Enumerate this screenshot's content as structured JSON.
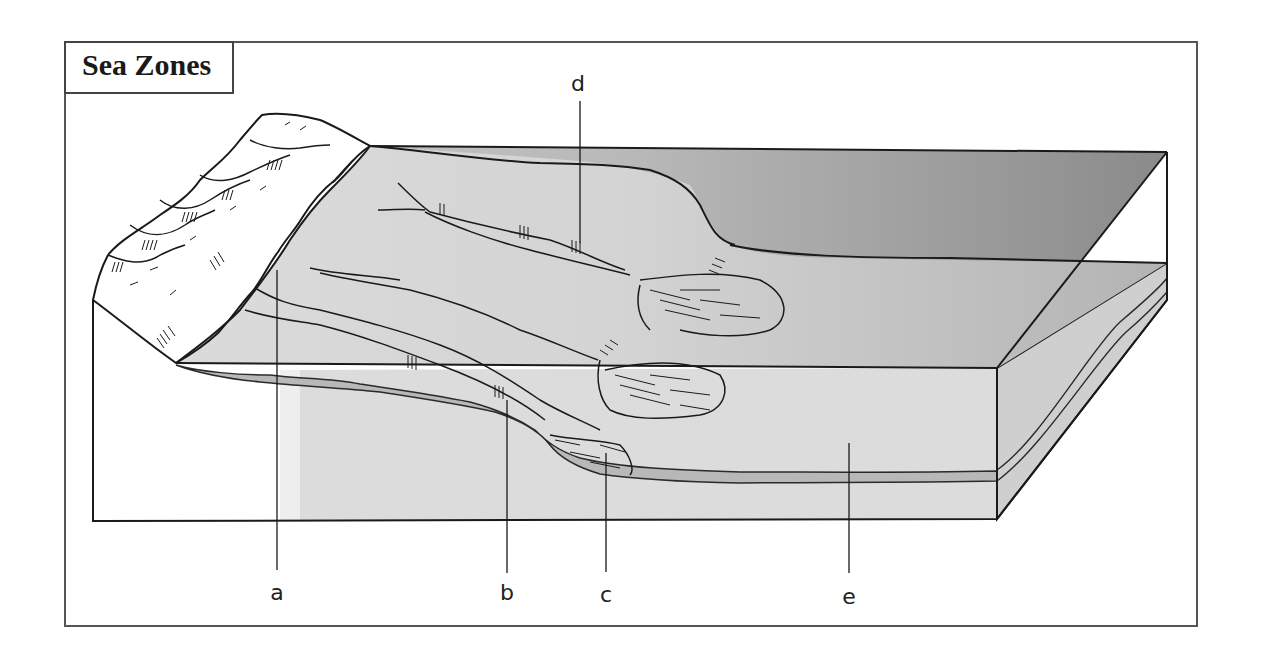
{
  "title": "Sea Zones",
  "labels": {
    "a": {
      "text": "a",
      "x": 277,
      "y": 582
    },
    "b": {
      "text": "b",
      "x": 507,
      "y": 582
    },
    "c": {
      "text": "c",
      "x": 606,
      "y": 582
    },
    "d": {
      "text": "d",
      "x": 575,
      "y": 73
    },
    "e": {
      "text": "e",
      "x": 849,
      "y": 584
    }
  },
  "colors": {
    "frame": "#555555",
    "outline": "#1a1a1a",
    "sea_light": "#dcdcdc",
    "sea_dark": "#8e8e8e",
    "block_face": "#d9d9d9",
    "block_side": "#cfcfcf",
    "sediment_band": "#b5b5b5",
    "land": "#ffffff"
  }
}
